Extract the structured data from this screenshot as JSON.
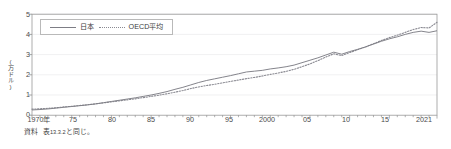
{
  "figure": {
    "source_label": "資料",
    "source_text_pre": "表",
    "source_text_num": "13.3.2",
    "source_text_post": "と同じ。",
    "source_full": "資料　表13.3.2と同じ。"
  },
  "colors": {
    "japan_line": "#7d7d85",
    "oecd_line": "#8a8a92",
    "frame": "#9a9a9a",
    "grid": "#e4e4e6",
    "text": "#3d3d3d"
  },
  "legend": {
    "position": "top-left-inside",
    "entries": [
      {
        "label": "日本",
        "style": "solid",
        "icon": "solid-line-swatch-icon"
      },
      {
        "label": "OECD平均",
        "style": "dotted",
        "icon": "dotted-line-swatch-icon"
      }
    ]
  },
  "chart_data": {
    "type": "line",
    "title": "",
    "subtitle": "",
    "xlabel": "",
    "ylabel": "(万ドル)",
    "ylim": [
      0,
      5
    ],
    "yticks": [
      0,
      1,
      2,
      3,
      4,
      5
    ],
    "ytick_labels": [
      "0",
      "1",
      "2",
      "3",
      "4",
      "5"
    ],
    "xlim": [
      1970,
      2021
    ],
    "xticks": [
      1970,
      1975,
      1980,
      1985,
      1990,
      1995,
      2000,
      2005,
      2010,
      2015,
      2021
    ],
    "xtick_labels": [
      "1970年",
      "75",
      "80",
      "85",
      "90",
      "95",
      "2000",
      "05",
      "10",
      "15",
      "2021"
    ],
    "minor_xticks_interval": 1,
    "grid": "horizontal-faint",
    "legend_position": "upper-left",
    "x": [
      1970,
      1971,
      1972,
      1973,
      1974,
      1975,
      1976,
      1977,
      1978,
      1979,
      1980,
      1981,
      1982,
      1983,
      1984,
      1985,
      1986,
      1987,
      1988,
      1989,
      1990,
      1991,
      1992,
      1993,
      1994,
      1995,
      1996,
      1997,
      1998,
      1999,
      2000,
      2001,
      2002,
      2003,
      2004,
      2005,
      2006,
      2007,
      2008,
      2009,
      2010,
      2011,
      2012,
      2013,
      2014,
      2015,
      2016,
      2017,
      2018,
      2019,
      2020,
      2021
    ],
    "series": [
      {
        "name": "日本",
        "style": "solid",
        "values": [
          0.26,
          0.28,
          0.31,
          0.35,
          0.39,
          0.43,
          0.47,
          0.51,
          0.56,
          0.62,
          0.68,
          0.74,
          0.8,
          0.86,
          0.93,
          1.0,
          1.08,
          1.17,
          1.28,
          1.38,
          1.5,
          1.62,
          1.72,
          1.8,
          1.88,
          1.96,
          2.05,
          2.14,
          2.18,
          2.22,
          2.29,
          2.34,
          2.4,
          2.48,
          2.6,
          2.72,
          2.84,
          2.98,
          3.12,
          3.02,
          3.15,
          3.26,
          3.38,
          3.52,
          3.66,
          3.78,
          3.88,
          4.0,
          4.1,
          4.16,
          4.1,
          4.18
        ]
      },
      {
        "name": "OECD平均",
        "style": "dotted",
        "values": [
          0.3,
          0.32,
          0.34,
          0.37,
          0.41,
          0.44,
          0.48,
          0.52,
          0.56,
          0.61,
          0.66,
          0.71,
          0.76,
          0.81,
          0.87,
          0.93,
          0.99,
          1.06,
          1.14,
          1.22,
          1.32,
          1.4,
          1.47,
          1.53,
          1.6,
          1.67,
          1.74,
          1.81,
          1.87,
          1.94,
          2.02,
          2.09,
          2.17,
          2.27,
          2.4,
          2.54,
          2.7,
          2.88,
          3.04,
          2.95,
          3.1,
          3.24,
          3.38,
          3.54,
          3.7,
          3.84,
          3.96,
          4.1,
          4.24,
          4.34,
          4.32,
          4.6
        ]
      }
    ],
    "annotations": []
  }
}
